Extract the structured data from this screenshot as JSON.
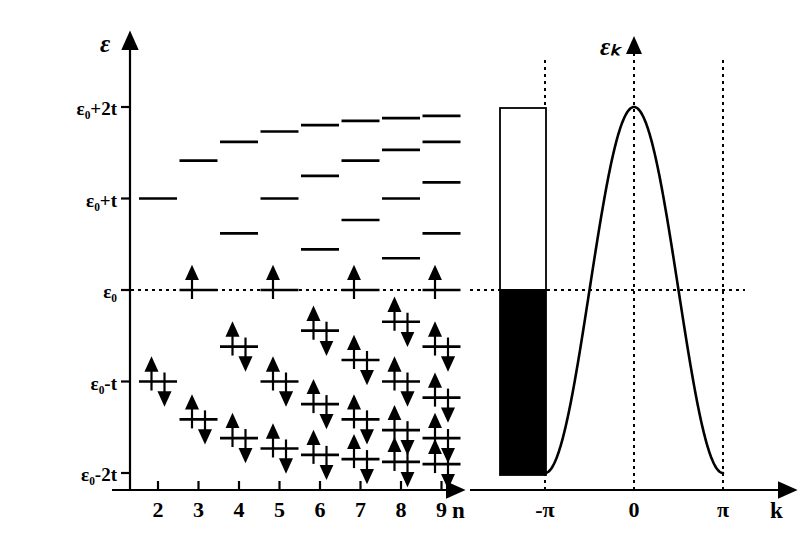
{
  "figure": {
    "title_text": "",
    "ink_color": "#000000",
    "background_color": "#ffffff"
  },
  "left_panel": {
    "y_axis": {
      "label": "ε",
      "ticks": [
        {
          "key": "e0p2t",
          "label": "ε₀+2t",
          "value": 2
        },
        {
          "key": "e0pt",
          "label": "ε₀+t",
          "value": 1
        },
        {
          "key": "e0",
          "label": "ε₀",
          "value": 0
        },
        {
          "key": "e0mt",
          "label": "ε₀-t",
          "value": -1
        },
        {
          "key": "e0m2t",
          "label": "ε₀-2t",
          "value": -2
        }
      ]
    },
    "x_axis": {
      "label": "n",
      "ticks": [
        "2",
        "3",
        "4",
        "5",
        "6",
        "7",
        "8",
        "9"
      ]
    },
    "fermi_line": {
      "label": "ε₀",
      "style": "dotted",
      "value": 0
    },
    "columns": [
      {
        "n": 2,
        "levels": [
          {
            "energy": 1.0,
            "electrons": 0
          },
          {
            "energy": -1.0,
            "electrons": 2
          }
        ]
      },
      {
        "n": 3,
        "levels": [
          {
            "energy": 1.414,
            "electrons": 0
          },
          {
            "energy": 0.0,
            "electrons": 1
          },
          {
            "energy": -1.414,
            "electrons": 2
          }
        ]
      },
      {
        "n": 4,
        "levels": [
          {
            "energy": 1.618,
            "electrons": 0
          },
          {
            "energy": 0.618,
            "electrons": 0
          },
          {
            "energy": -0.618,
            "electrons": 2
          },
          {
            "energy": -1.618,
            "electrons": 2
          }
        ]
      },
      {
        "n": 5,
        "levels": [
          {
            "energy": 1.732,
            "electrons": 0
          },
          {
            "energy": 1.0,
            "electrons": 0
          },
          {
            "energy": 0.0,
            "electrons": 1
          },
          {
            "energy": -1.0,
            "electrons": 2
          },
          {
            "energy": -1.732,
            "electrons": 2
          }
        ]
      },
      {
        "n": 6,
        "levels": [
          {
            "energy": 1.802,
            "electrons": 0
          },
          {
            "energy": 1.247,
            "electrons": 0
          },
          {
            "energy": 0.445,
            "electrons": 0
          },
          {
            "energy": -0.445,
            "electrons": 2
          },
          {
            "energy": -1.247,
            "electrons": 2
          },
          {
            "energy": -1.802,
            "electrons": 2
          }
        ]
      },
      {
        "n": 7,
        "levels": [
          {
            "energy": 1.848,
            "electrons": 0
          },
          {
            "energy": 1.414,
            "electrons": 0
          },
          {
            "energy": 0.765,
            "electrons": 0
          },
          {
            "energy": 0.0,
            "electrons": 1
          },
          {
            "energy": -0.765,
            "electrons": 2
          },
          {
            "energy": -1.414,
            "electrons": 2
          },
          {
            "energy": -1.848,
            "electrons": 2
          }
        ]
      },
      {
        "n": 8,
        "levels": [
          {
            "energy": 1.879,
            "electrons": 0
          },
          {
            "energy": 1.532,
            "electrons": 0
          },
          {
            "energy": 1.0,
            "electrons": 0
          },
          {
            "energy": 0.347,
            "electrons": 0
          },
          {
            "energy": -0.347,
            "electrons": 2
          },
          {
            "energy": -1.0,
            "electrons": 2
          },
          {
            "energy": -1.532,
            "electrons": 2
          },
          {
            "energy": -1.879,
            "electrons": 2
          }
        ]
      },
      {
        "n": 9,
        "levels": [
          {
            "energy": 1.902,
            "electrons": 0
          },
          {
            "energy": 1.618,
            "electrons": 0
          },
          {
            "energy": 1.176,
            "electrons": 0
          },
          {
            "energy": 0.618,
            "electrons": 0
          },
          {
            "energy": 0.0,
            "electrons": 1
          },
          {
            "energy": -0.618,
            "electrons": 2
          },
          {
            "energy": -1.176,
            "electrons": 2
          },
          {
            "energy": -1.618,
            "electrons": 2
          },
          {
            "energy": -1.902,
            "electrons": 2
          }
        ]
      }
    ]
  },
  "right_panel": {
    "y_axis": {
      "label": "εₖ",
      "style": "dotted"
    },
    "x_axis": {
      "label": "k",
      "ticks": [
        {
          "label": "-π",
          "value": -3.14159
        },
        {
          "label": "0",
          "value": 0
        },
        {
          "label": "π",
          "value": 3.14159
        }
      ]
    },
    "band_box": {
      "top_value": 2,
      "bottom_value": -2,
      "fill_boundary_value": 0,
      "filled_color": "#000000",
      "empty_color": "#ffffff",
      "stroke_color": "#000000"
    },
    "fermi_line": {
      "style": "dotted",
      "value": 0
    }
  },
  "chart_data": {
    "type": "line",
    "title": "",
    "xlabel": "k",
    "ylabel": "εₖ",
    "xlim": [
      -3.9,
      3.55
    ],
    "ylim": [
      -2.35,
      2.35
    ],
    "grid": false,
    "legend_position": "none",
    "series": [
      {
        "name": "εₖ = ε₀ + 2t cos(k)",
        "x": [
          -3.14159,
          -2.8,
          -2.4,
          -2.0,
          -1.6,
          -1.2,
          -0.8,
          -0.4,
          0.0,
          0.4,
          0.8,
          1.2,
          1.6,
          2.0,
          2.4,
          2.8,
          3.14159
        ],
        "y": [
          2.0,
          1.886,
          1.472,
          0.832,
          0.058,
          -0.725,
          -1.393,
          -1.842,
          -2.0,
          -1.842,
          -1.393,
          -0.725,
          0.058,
          0.832,
          1.472,
          1.886,
          2.0
        ]
      }
    ],
    "annotations": [
      {
        "text": "-π",
        "x": -3.14159
      },
      {
        "text": "0",
        "x": 0
      },
      {
        "text": "π",
        "x": 3.14159
      }
    ]
  }
}
